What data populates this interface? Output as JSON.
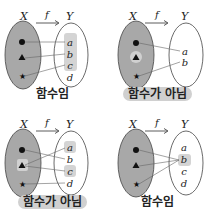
{
  "diagram": {
    "type": "function-mapping-examples",
    "colors": {
      "domain_fill": "#a8a8a8",
      "highlight": "#d4d4d4",
      "line": "#555555",
      "text": "#222222"
    },
    "panels": [
      {
        "set_x": "X",
        "set_y": "Y",
        "map": "f",
        "domain": [
          "●",
          "▲",
          "★"
        ],
        "codomain": [
          "a",
          "b",
          "c",
          "d"
        ],
        "mappings": [
          [
            "●",
            "a"
          ],
          [
            "▲",
            "b"
          ],
          [
            "★",
            "c"
          ]
        ],
        "highlighted": [
          "a",
          "b",
          "c"
        ],
        "caption": "함수임",
        "is_function": true
      },
      {
        "set_x": "X",
        "set_y": "Y",
        "map": "f",
        "domain": [
          "●",
          "▲",
          "★"
        ],
        "codomain": [
          "a",
          "b"
        ],
        "mappings": [
          [
            "●",
            "a"
          ],
          [
            "★",
            "b"
          ]
        ],
        "highlighted_domain": [
          "▲"
        ],
        "caption": "함수가 아님",
        "is_function": false
      },
      {
        "set_x": "X",
        "set_y": "Y",
        "map": "f",
        "domain": [
          "●",
          "▲",
          "★"
        ],
        "codomain": [
          "a",
          "b",
          "c",
          "d"
        ],
        "mappings": [
          [
            "●",
            "b"
          ],
          [
            "▲",
            "a"
          ],
          [
            "▲",
            "c"
          ],
          [
            "★",
            "d"
          ]
        ],
        "highlighted": [
          "a",
          "c"
        ],
        "highlighted_domain": [
          "▲"
        ],
        "caption": "함수가 아님",
        "is_function": false
      },
      {
        "set_x": "X",
        "set_y": "Y",
        "map": "f",
        "domain": [
          "●",
          "▲",
          "★"
        ],
        "codomain": [
          "a",
          "b",
          "c",
          "d"
        ],
        "mappings": [
          [
            "●",
            "b"
          ],
          [
            "▲",
            "b"
          ],
          [
            "★",
            "b"
          ]
        ],
        "highlighted": [
          "b"
        ],
        "caption": "함수임",
        "is_function": true
      }
    ]
  }
}
